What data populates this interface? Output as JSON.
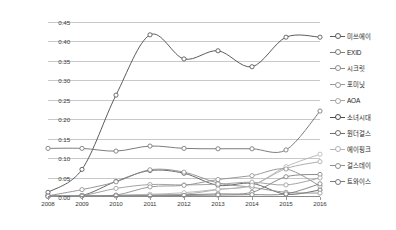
{
  "chart_data": {
    "type": "line",
    "title": "",
    "xlabel": "",
    "ylabel": "",
    "grid": true,
    "legend_position": "right",
    "categories": [
      2008,
      2009,
      2010,
      2011,
      2012,
      2013,
      2014,
      2015,
      2016
    ],
    "x_tick_labels": [
      "2008",
      "2009",
      "2010",
      "2011",
      "2012",
      "2013",
      "2014",
      "2015",
      "2016"
    ],
    "y_tick_labels": [
      "0.00",
      "0.05",
      "0.10",
      "0.15",
      "0.20",
      "0.25",
      "0.30",
      "0.35",
      "0.40",
      "0.45"
    ],
    "y_tick_values": [
      0.0,
      0.05,
      0.1,
      0.15,
      0.2,
      0.25,
      0.3,
      0.35,
      0.4,
      0.45
    ],
    "ylim": [
      0.0,
      0.45
    ],
    "xlim": [
      2008,
      2016
    ],
    "series": [
      {
        "name": "미쓰에이",
        "color": "#5a5a5a",
        "values": [
          0.004,
          0.004,
          0.04,
          0.068,
          0.061,
          0.03,
          0.035,
          0.007,
          0.018
        ]
      },
      {
        "name": "EXID",
        "color": "#7d7d7d",
        "values": [
          0.002,
          0.003,
          0.004,
          0.005,
          0.006,
          0.008,
          0.012,
          0.052,
          0.058
        ]
      },
      {
        "name": "시크릿",
        "color": "#8c8c8c",
        "values": [
          0.003,
          0.019,
          0.039,
          0.07,
          0.064,
          0.036,
          0.025,
          0.012,
          0.01
        ]
      },
      {
        "name": "포미닛",
        "color": "#9a9a9a",
        "values": [
          0.003,
          0.004,
          0.022,
          0.032,
          0.031,
          0.033,
          0.038,
          0.031,
          0.049
        ]
      },
      {
        "name": "AOA",
        "color": "#a5a5a5",
        "values": [
          0.002,
          0.003,
          0.004,
          0.005,
          0.007,
          0.019,
          0.03,
          0.073,
          0.091
        ]
      },
      {
        "name": "소녀시대",
        "color": "#4a4a4a",
        "values": [
          0.012,
          0.071,
          0.262,
          0.417,
          0.355,
          0.376,
          0.335,
          0.411,
          0.411
        ]
      },
      {
        "name": "원더걸스",
        "color": "#6e6e6e",
        "values": [
          0.125,
          0.125,
          0.118,
          0.131,
          0.125,
          0.124,
          0.124,
          0.121,
          0.221
        ]
      },
      {
        "name": "에이핑크",
        "color": "#b4b4b4",
        "values": [
          0.002,
          0.003,
          0.004,
          0.007,
          0.011,
          0.02,
          0.03,
          0.078,
          0.11
        ]
      },
      {
        "name": "걸스데이",
        "color": "#8f8f8f",
        "values": [
          0.002,
          0.003,
          0.005,
          0.026,
          0.03,
          0.045,
          0.055,
          0.072,
          0.028
        ]
      },
      {
        "name": "트와이스",
        "color": "#7a7a7a",
        "values": [
          0.002,
          0.002,
          0.003,
          0.003,
          0.004,
          0.005,
          0.006,
          0.008,
          0.034
        ]
      }
    ]
  },
  "legend": {
    "items": [
      {
        "label": "미쓰에이"
      },
      {
        "label": "EXID"
      },
      {
        "label": "시크릿"
      },
      {
        "label": "포미닛"
      },
      {
        "label": "AOA"
      },
      {
        "label": "소녀시대"
      },
      {
        "label": "원더걸스"
      },
      {
        "label": "에이핑크"
      },
      {
        "label": "걸스데이"
      },
      {
        "label": "트와이스"
      }
    ]
  }
}
